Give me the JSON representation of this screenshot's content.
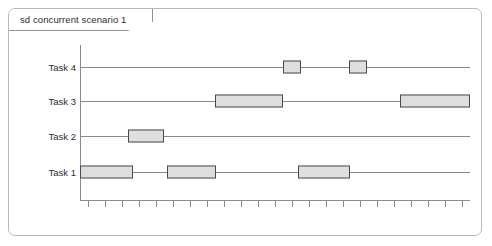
{
  "diagram": {
    "kind": "uml-timing-diagram",
    "fragment_label": "sd concurrent scenario 1",
    "colors": {
      "frame_border": "#b8b8b8",
      "tab_border": "#909090",
      "axis": "#8c8c8c",
      "lifeline": "#8a8a8a",
      "bar_fill": "#dedede",
      "bar_border": "#4a4a4a",
      "text": "#2b2b2b",
      "background": "#ffffff"
    }
  },
  "chart_data": {
    "type": "bar",
    "title": "sd concurrent scenario 1",
    "xlabel": "",
    "ylabel": "",
    "orientation": "horizontal-gantt",
    "grid": false,
    "legend": null,
    "axis": {
      "x_origin_px": 80,
      "x_end_px": 470,
      "baseline_y_px": 200,
      "tick_count": 23,
      "tick_spacing_px": 17,
      "tick_first_px": 88,
      "tick_labels": []
    },
    "categories": [
      "Task 4",
      "Task 3",
      "Task 2",
      "Task 1"
    ],
    "lanes": [
      {
        "label": "Task 4",
        "y_px": 67,
        "bars": [
          {
            "x_px": 283,
            "width_px": 18
          },
          {
            "x_px": 349,
            "width_px": 18
          }
        ]
      },
      {
        "label": "Task 3",
        "y_px": 101,
        "bars": [
          {
            "x_px": 215,
            "width_px": 68
          },
          {
            "x_px": 400,
            "width_px": 70
          }
        ]
      },
      {
        "label": "Task 2",
        "y_px": 136,
        "bars": [
          {
            "x_px": 128,
            "width_px": 36
          }
        ]
      },
      {
        "label": "Task 1",
        "y_px": 172,
        "bars": [
          {
            "x_px": 80,
            "width_px": 53
          },
          {
            "x_px": 167,
            "width_px": 49
          },
          {
            "x_px": 298,
            "width_px": 52
          }
        ]
      }
    ]
  }
}
